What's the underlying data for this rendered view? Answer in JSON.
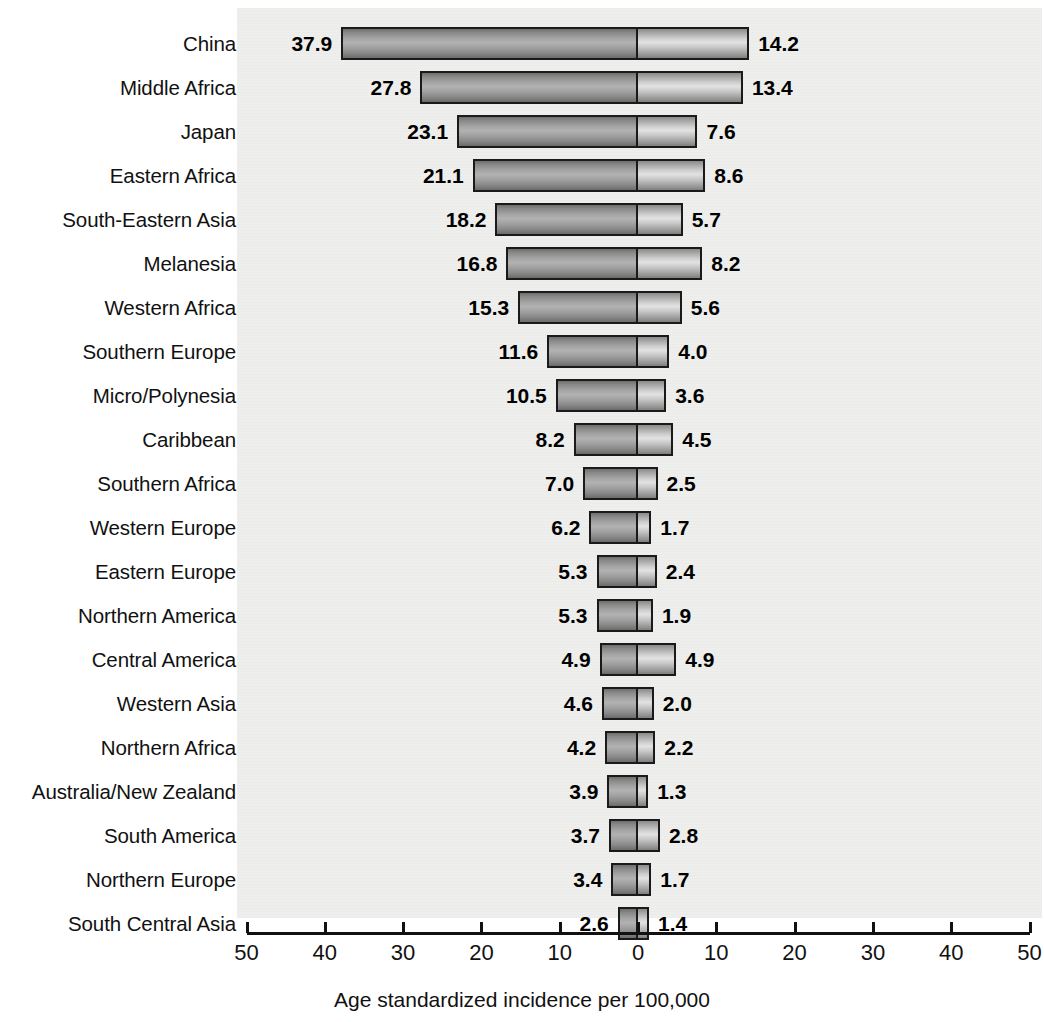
{
  "chart_data": {
    "type": "bar",
    "subtype": "diverging-horizontal-bar",
    "title": "",
    "xlabel": "Age standardized incidence per 100,000",
    "ylabel": "",
    "xlim": [
      -50,
      50
    ],
    "xticks": [
      50,
      40,
      30,
      20,
      10,
      0,
      10,
      20,
      30,
      40,
      50
    ],
    "grid": false,
    "legend": "none",
    "categories": [
      "China",
      "Middle Africa",
      "Japan",
      "Eastern Africa",
      "South-Eastern Asia",
      "Melanesia",
      "Western Africa",
      "Southern Europe",
      "Micro/Polynesia",
      "Caribbean",
      "Southern Africa",
      "Western Europe",
      "Eastern Europe",
      "Northern America",
      "Central America",
      "Western Asia",
      "Northern Africa",
      "Australia/New Zealand",
      "South America",
      "Northern Europe",
      "South Central Asia"
    ],
    "series": [
      {
        "name": "left",
        "side": "left",
        "values": [
          37.9,
          27.8,
          23.1,
          21.1,
          18.2,
          16.8,
          15.3,
          11.6,
          10.5,
          8.2,
          7.0,
          6.2,
          5.3,
          5.3,
          4.9,
          4.6,
          4.2,
          3.9,
          3.7,
          3.4,
          2.6
        ]
      },
      {
        "name": "right",
        "side": "right",
        "values": [
          14.2,
          13.4,
          7.6,
          8.6,
          5.7,
          8.2,
          5.6,
          4.0,
          3.6,
          4.5,
          2.5,
          1.7,
          2.4,
          1.9,
          4.9,
          2.0,
          2.2,
          1.3,
          2.8,
          1.7,
          1.4
        ]
      }
    ],
    "left_labels": [
      "37.9",
      "27.8",
      "23.1",
      "21.1",
      "18.2",
      "16.8",
      "15.3",
      "11.6",
      "10.5",
      "8.2",
      "7.0",
      "6.2",
      "5.3",
      "5.3",
      "4.9",
      "4.6",
      "4.2",
      "3.9",
      "3.7",
      "3.4",
      "2.6"
    ],
    "right_labels": [
      "14.2",
      "13.4",
      "7.6",
      "8.6",
      "5.7",
      "8.2",
      "5.6",
      "4.0",
      "3.6",
      "4.5",
      "2.5",
      "1.7",
      "2.4",
      "1.9",
      "4.9",
      "2.0",
      "2.2",
      "1.3",
      "2.8",
      "1.7",
      "1.4"
    ],
    "colors": {
      "left_fill": "#a6a6a6",
      "right_fill": "#d0d0d0",
      "outline": "#1a1a1a",
      "panel_background": "#eeeeec",
      "text": "#111111"
    }
  },
  "axis": {
    "title": "Age standardized incidence per 100,000",
    "tick_labels": [
      "50",
      "40",
      "30",
      "20",
      "10",
      "0",
      "10",
      "20",
      "30",
      "40",
      "50"
    ]
  }
}
